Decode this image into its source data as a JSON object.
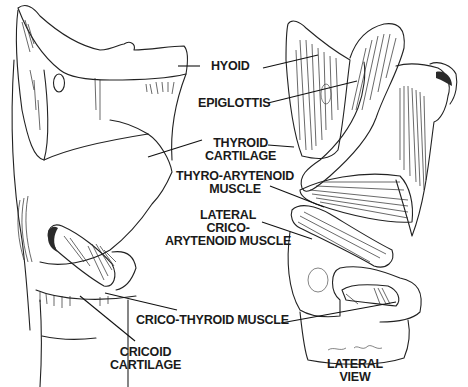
{
  "figure": {
    "views": [
      {
        "id": "anterior-left",
        "caption": ""
      },
      {
        "id": "lateral",
        "caption": [
          "LATERAL",
          "VIEW"
        ]
      }
    ],
    "labels": [
      {
        "id": "hyoid",
        "lines": [
          "HYOID"
        ]
      },
      {
        "id": "epiglottis",
        "lines": [
          "EPIGLOTTIS"
        ]
      },
      {
        "id": "thyroid-cartilage",
        "lines": [
          "THYROID",
          "CARTILAGE"
        ]
      },
      {
        "id": "thyro-arytenoid-muscle",
        "lines": [
          "THYRO-ARYTENOID",
          "MUSCLE"
        ]
      },
      {
        "id": "lateral-crico-arytenoid-muscle",
        "lines": [
          "LATERAL",
          "CRICO-",
          "ARYTENOID MUSCLE"
        ]
      },
      {
        "id": "crico-thyroid-muscle",
        "lines": [
          "CRICO-THYROID MUSCLE"
        ]
      },
      {
        "id": "cricoid-cartilage",
        "lines": [
          "CRICOID",
          "CARTILAGE"
        ]
      }
    ],
    "colors": {
      "ink": "#222222",
      "background": "#ffffff"
    }
  }
}
